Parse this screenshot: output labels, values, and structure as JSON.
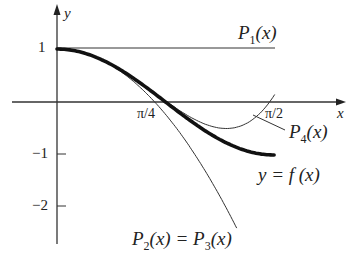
{
  "chart_data": {
    "type": "line",
    "title": "",
    "xlabel": "x",
    "ylabel": "y",
    "x_ticks": [
      "π/4",
      "π/2"
    ],
    "y_ticks": [
      "1",
      "−1",
      "−2"
    ],
    "xlim": [
      0,
      1.57
    ],
    "ylim": [
      -2.5,
      1.4
    ],
    "grid": false,
    "series": [
      {
        "name": "y = f(x)",
        "expr": "cos(2x)",
        "style": "thick",
        "x": [
          0,
          0.3927,
          0.7854,
          1.1781,
          1.5708
        ],
        "values": [
          1,
          0.7071,
          0,
          -0.7071,
          -1
        ]
      },
      {
        "name": "P1(x)",
        "expr": "1",
        "style": "thin",
        "x": [
          0,
          1.5708
        ],
        "values": [
          1,
          1
        ]
      },
      {
        "name": "P2(x) = P3(x)",
        "expr": "1 - 2x^2",
        "style": "thin",
        "x": [
          0,
          0.3927,
          0.7854,
          1.1
        ],
        "values": [
          1,
          0.6916,
          -0.2337,
          -1.42
        ]
      },
      {
        "name": "P4(x)",
        "expr": "1 - 2x^2 + (2/3)x^4",
        "style": "thin",
        "x": [
          0,
          0.3927,
          0.7854,
          1.1781,
          1.5708
        ],
        "values": [
          1,
          0.7071,
          -0.0234,
          -0.4517,
          0.0194
        ]
      }
    ]
  },
  "labels": {
    "y_axis": "y",
    "x_axis": "x",
    "tick_1": "1",
    "tick_m1": "−1",
    "tick_m2": "−2",
    "tick_pi4": "π/4",
    "tick_pi2": "π/2",
    "p1": {
      "main": "P",
      "sub": "1",
      "arg": "(x)"
    },
    "p4": {
      "main": "P",
      "sub": "4",
      "arg": "(x)"
    },
    "f": "y = f (x)",
    "p23": {
      "main1": "P",
      "sub1": "2",
      "arg1": "(x) = ",
      "main2": "P",
      "sub2": "3",
      "arg2": "(x)"
    }
  }
}
